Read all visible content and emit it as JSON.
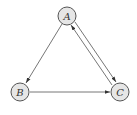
{
  "diagram": {
    "type": "directed-graph",
    "nodes": [
      {
        "id": "A",
        "label": "A",
        "x": 67,
        "y": 16
      },
      {
        "id": "B",
        "label": "B",
        "x": 20,
        "y": 92
      },
      {
        "id": "C",
        "label": "C",
        "x": 120,
        "y": 92
      }
    ],
    "edges": [
      {
        "from": "A",
        "to": "B"
      },
      {
        "from": "B",
        "to": "C"
      },
      {
        "from": "A",
        "to": "C"
      },
      {
        "from": "C",
        "to": "A"
      }
    ],
    "colors": {
      "node_fill": "#e6e6e6",
      "node_stroke": "#555555",
      "edge": "#666666",
      "label": "#333333"
    }
  }
}
